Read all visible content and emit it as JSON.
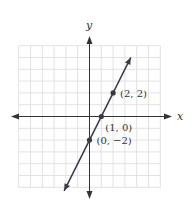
{
  "chart_data": {
    "type": "line",
    "title": "",
    "xlabel": "x",
    "ylabel": "y",
    "grid": true,
    "xlim": [
      -6,
      6
    ],
    "ylim": [
      -6,
      6
    ],
    "line": {
      "equation": "y = 2x - 2",
      "slope": 2,
      "intercept": -2
    },
    "points": [
      {
        "x": 2,
        "y": 2,
        "label": "(2, 2)"
      },
      {
        "x": 1,
        "y": 0,
        "label": "(1, 0)"
      },
      {
        "x": 0,
        "y": -2,
        "label": "(0, −2)"
      }
    ],
    "colors": {
      "line": "#3a3a4a",
      "axis": "#333333",
      "grid": "#e2e2e2"
    }
  }
}
